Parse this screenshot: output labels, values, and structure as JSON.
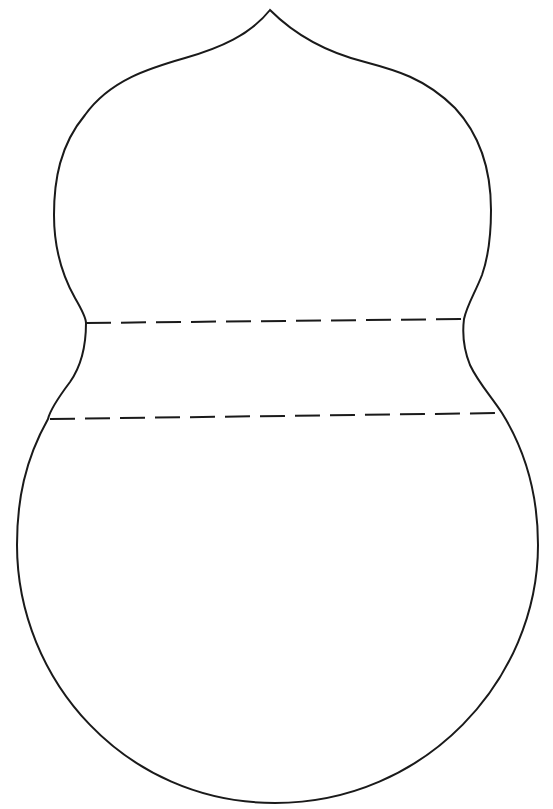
{
  "figure": {
    "title": "Gourd shape template",
    "background": "#ffffff",
    "stroke_color": "#1a1a1a",
    "outline": {
      "description": "Double-bulb gourd outline with pointed tip",
      "tip_point": [
        270,
        10
      ],
      "upper_bulb_left_x": 54,
      "upper_bulb_right_x": 491,
      "neck_left": [
        86,
        323
      ],
      "neck_right": [
        464,
        319
      ],
      "lower_bulb_left_x": 17,
      "lower_bulb_right_x": 538,
      "bottom_y": 803
    },
    "fold_lines": [
      {
        "name": "upper-fold-line",
        "style": "dashed",
        "start": [
          86,
          323
        ],
        "end": [
          464,
          319
        ]
      },
      {
        "name": "lower-fold-line",
        "style": "dashed",
        "start": [
          50,
          419
        ],
        "end": [
          502,
          413
        ]
      }
    ],
    "dash_pattern": {
      "dash": 25,
      "gap": 10
    }
  }
}
